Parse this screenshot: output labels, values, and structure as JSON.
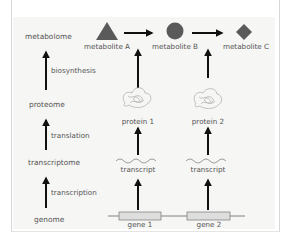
{
  "levels": [
    {
      "label": "metabolome"
    },
    {
      "label": "proteome"
    },
    {
      "label": "transcriptome"
    },
    {
      "label": "genome"
    }
  ],
  "processes": [
    {
      "label": "biosynthesis"
    },
    {
      "label": "translation"
    },
    {
      "label": "transcription"
    }
  ],
  "metabolites": [
    {
      "label": "metabolite A",
      "shape": "triangle"
    },
    {
      "label": "metabolite B",
      "shape": "circle"
    },
    {
      "label": "metabolite C",
      "shape": "diamond"
    }
  ],
  "proteins": [
    {
      "label": "protein 1"
    },
    {
      "label": "protein 2"
    }
  ],
  "transcripts": [
    {
      "label": "transcript"
    },
    {
      "label": "transcript"
    }
  ],
  "genes": [
    {
      "label": "gene 1"
    },
    {
      "label": "gene 2"
    }
  ],
  "colors": {
    "shape_fill": "#5a5a5a",
    "arrow": "#111111",
    "panel": "#f6f6f4",
    "gene_box": "#dedede",
    "protein_line": "#aaaaaa"
  }
}
